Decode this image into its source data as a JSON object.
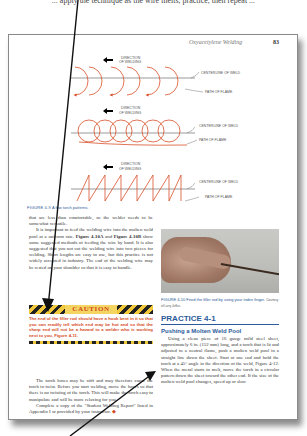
{
  "top_cut_text": "... apply the technique as the wire melts, practice, then repeat ...",
  "page": {
    "running_head": "Oxyacetylene Welding",
    "page_number": "83"
  },
  "figure_4_9": {
    "patterns": [
      {
        "name": "half-circle",
        "direction_label_1": "DIRECTION",
        "direction_label_2": "OF WELDING",
        "centerline_label": "CENTERLINE OF WELD",
        "path_label": "PATH OF FLAME"
      },
      {
        "name": "circular",
        "direction_label_1": "DIRECTION",
        "direction_label_2": "OF WELDING",
        "centerline_label": "CENTERLINE OF WELD",
        "path_label": "PATH OF FLAME"
      },
      {
        "name": "zigzag",
        "direction_label_1": "DIRECTION",
        "direction_label_2": "OF WELDING",
        "centerline_label": "CENTERLINE OF WELD",
        "path_label": "PATH OF FLAME"
      }
    ],
    "caption_label": "FIGURE 4-9",
    "caption_text": "A few torch patterns.",
    "color": "#d9502a"
  },
  "left_column": {
    "p1": "that are less than comfortable, so the welder needs to be somewhat versatile.",
    "p2_a": "It is important to feed the welding wire into the molten weld pool at a uniform rate. ",
    "p2_ref1": "Figure 4-10A",
    "p2_b": " and ",
    "p2_ref2": "Figure 4-10B",
    "p2_c": " show some suggested methods of feeding the wire by hand. It is also suggested that you not cut the welding wire into two pieces for welding. Short lengths are easy to use, but this practice is not widely accepted in industry. The end of the welding wire may be rested on your shoulder so that it is easy to handle."
  },
  "caution": {
    "title": "CAUTION",
    "text": "The end of the filler rod should have a hook bent in it so that you can readily tell which end may be hot and so that the sharp end will not be a hazard to a welder who is working next to you, Figure 4-11."
  },
  "left_column_2": {
    "p1": "The torch hoses may be stiff and may therefore cause the torch to twist. Before you start welding, move the hoses so that there is no twisting of the torch. This will make the torch easy to manipulate and will be more relaxing for you.",
    "p2": "Complete a copy of the \"Student Welding Report\" listed in Appendix I or provided by your instructor.",
    "end_mark": "◆"
  },
  "figure_4_10": {
    "caption_label": "FIGURE 4-10",
    "caption_text": "Feed the filler rod by using your index finger.",
    "credit": "Courtesy of Larry Jeffus."
  },
  "practice": {
    "title": "PRACTICE 4-1",
    "subtitle": "Pushing a Molten Weld Pool",
    "text": "Using a clean piece of 16 gauge mild steel sheet, approximately 6 in. (152 mm) long, and a torch that is lit and adjusted to a neutral flame, push a molten weld pool in a straight line down the sheet. Start at one end and hold the torch at a 45° angle in the direction of the weld, Figure 4-12. When the metal starts to melt, move the torch in a circular pattern down the sheet toward the other end. If the size of the molten weld pool changes, speed up or slow"
  },
  "annotations": {
    "arrow_color": "#111111"
  }
}
